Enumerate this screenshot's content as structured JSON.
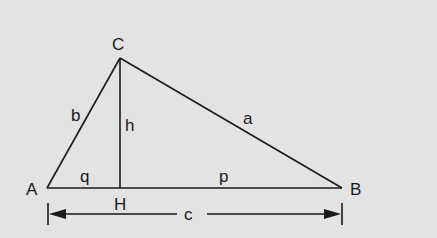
{
  "diagram": {
    "type": "right-triangle-altitude",
    "colors": {
      "background": "#e3e3e3",
      "stroke": "#1a1a1a"
    },
    "vertices": [
      {
        "id": "A",
        "label": "A",
        "x": 47,
        "y": 188,
        "lx": 26,
        "ly": 195
      },
      {
        "id": "B",
        "label": "B",
        "x": 342,
        "y": 188,
        "lx": 350,
        "ly": 195
      },
      {
        "id": "C",
        "label": "C",
        "x": 120,
        "y": 58,
        "lx": 112,
        "ly": 50
      },
      {
        "id": "H",
        "label": "H",
        "x": 120,
        "y": 188,
        "lx": 114,
        "ly": 210
      }
    ],
    "segment_labels": [
      {
        "id": "a",
        "label": "a",
        "x": 243,
        "y": 124
      },
      {
        "id": "b",
        "label": "b",
        "x": 71,
        "y": 121
      },
      {
        "id": "h",
        "label": "h",
        "x": 125,
        "y": 131
      },
      {
        "id": "q",
        "label": "q",
        "x": 80,
        "y": 182
      },
      {
        "id": "p",
        "label": "p",
        "x": 219,
        "y": 182
      }
    ],
    "dimension": {
      "label": "c",
      "x1": 48,
      "x2": 342,
      "y": 214,
      "label_x": 184,
      "label_y": 220
    }
  }
}
